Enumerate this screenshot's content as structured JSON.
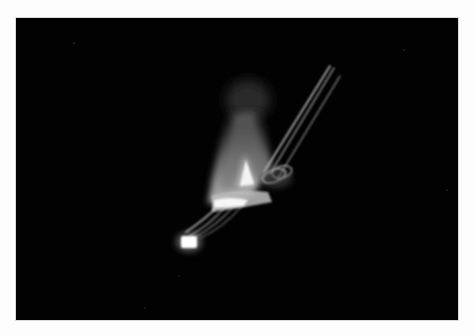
{
  "photo": {
    "subject": "light-painting long exposure",
    "alt": "Long exposure photograph of white light trails forming a bright cone shape with streaks against a black background",
    "colors": {
      "border": "#fdfdfd",
      "background": "#020202",
      "highlight": "#ffffff",
      "glow": "#cfcfcf",
      "haze": "#6a6a6a"
    }
  }
}
